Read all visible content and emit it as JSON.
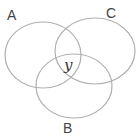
{
  "diagram": {
    "type": "venn",
    "sets": [
      {
        "id": "A",
        "label": "A",
        "cx": 43,
        "cy": 55,
        "rx": 38,
        "ry": 33
      },
      {
        "id": "C",
        "label": "C",
        "cx": 95,
        "cy": 51,
        "rx": 40,
        "ry": 33
      },
      {
        "id": "B",
        "label": "B",
        "cx": 74,
        "cy": 86,
        "rx": 38,
        "ry": 32
      }
    ],
    "region_label": "y",
    "stroke_color": "#b0b0b0"
  }
}
